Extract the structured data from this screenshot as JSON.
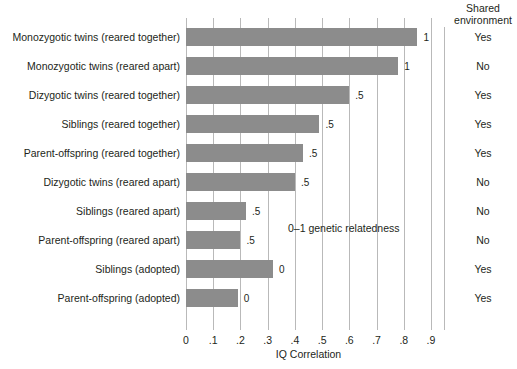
{
  "chart_data": {
    "type": "bar",
    "orientation": "horizontal",
    "title": "",
    "xlabel": "IQ Correlation",
    "ylabel": "",
    "xlim": [
      0,
      0.9
    ],
    "grid": true,
    "legend": "none",
    "categories": [
      "Monozygotic twins (reared together)",
      "Monozygotic twins (reared apart)",
      "Dizygotic twins (reared together)",
      "Siblings (reared together)",
      "Parent-offspring (reared together)",
      "Dizygotic twins (reared apart)",
      "Siblings (reared apart)",
      "Parent-offspring (reared apart)",
      "Siblings (adopted)",
      "Parent-offspring (adopted)"
    ],
    "values": [
      0.85,
      0.78,
      0.6,
      0.49,
      0.43,
      0.4,
      0.22,
      0.2,
      0.32,
      0.19
    ],
    "bar_labels": [
      "1",
      "1",
      ".5",
      ".5",
      ".5",
      ".5",
      ".5",
      ".5",
      "0",
      "0"
    ],
    "x_ticks": [
      0,
      0.1,
      0.2,
      0.3,
      0.4,
      0.5,
      0.6,
      0.7,
      0.8,
      0.9
    ],
    "x_tick_labels": [
      "0",
      ".1",
      ".2",
      ".3",
      ".4",
      ".5",
      ".6",
      ".7",
      ".8",
      ".9"
    ],
    "annotation": "0–1 genetic relatedness",
    "bar_color": "#8c8c8c",
    "grid_color": "#b9b9b9",
    "text_color": "#231f20"
  },
  "right_column": {
    "header_line1": "Shared",
    "header_line2": "environment",
    "values": [
      "Yes",
      "No",
      "Yes",
      "Yes",
      "Yes",
      "No",
      "No",
      "No",
      "Yes",
      "Yes"
    ]
  }
}
